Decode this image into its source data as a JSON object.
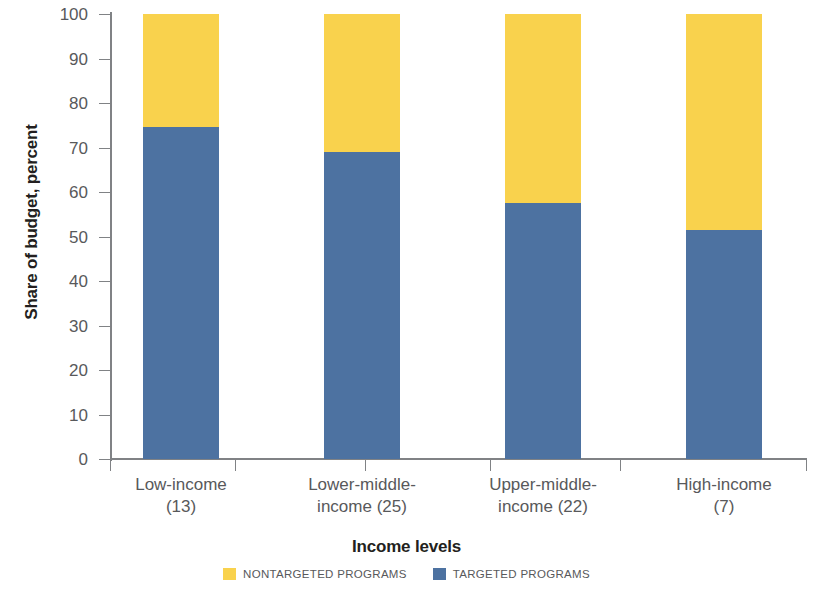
{
  "chart_data": {
    "type": "bar",
    "stacked": true,
    "stacked_mode": "100-percent",
    "title": "",
    "xlabel": "Income levels",
    "ylabel": "Share of budget, percent",
    "ylim": [
      0,
      100
    ],
    "ytick_labels": [
      "100",
      "90",
      "80",
      "70",
      "60",
      "50",
      "40",
      "30",
      "20",
      "10",
      "0"
    ],
    "ytick_values": [
      100,
      90,
      80,
      70,
      60,
      50,
      40,
      30,
      20,
      10,
      0
    ],
    "grid": false,
    "legend_position": "bottom",
    "categories": [
      "Low-income\n(13)",
      "Lower-middle-\nincome (25)",
      "Upper-middle-\nincome (22)",
      "High-income\n(7)"
    ],
    "category_lines": [
      [
        "Low-income",
        "(13)"
      ],
      [
        "Lower-middle-",
        "income (25)"
      ],
      [
        "Upper-middle-",
        "income (22)"
      ],
      [
        "High-income",
        "(7)"
      ]
    ],
    "series": [
      {
        "name": "NONTARGETED PROGRAMS",
        "color": "#f9d24d",
        "values": [
          25.5,
          31.0,
          42.5,
          48.5
        ]
      },
      {
        "name": "TARGETED PROGRAMS",
        "color": "#4d72a1",
        "values": [
          74.5,
          69.0,
          57.5,
          51.5
        ]
      }
    ]
  },
  "axes": {
    "y_title": "Share of budget, percent",
    "x_title": "Income levels"
  },
  "legend": {
    "items": [
      {
        "label": "NONTARGETED PROGRAMS",
        "color": "#f9d24d",
        "swatch": "nontargeted"
      },
      {
        "label": "TARGETED PROGRAMS",
        "color": "#4d72a1",
        "swatch": "targeted"
      }
    ]
  },
  "colors": {
    "nontargeted": "#f9d24d",
    "targeted": "#4d72a1",
    "axis": "#808285",
    "tick_text": "#58595b",
    "title_text": "#231f20",
    "background": "#ffffff"
  }
}
